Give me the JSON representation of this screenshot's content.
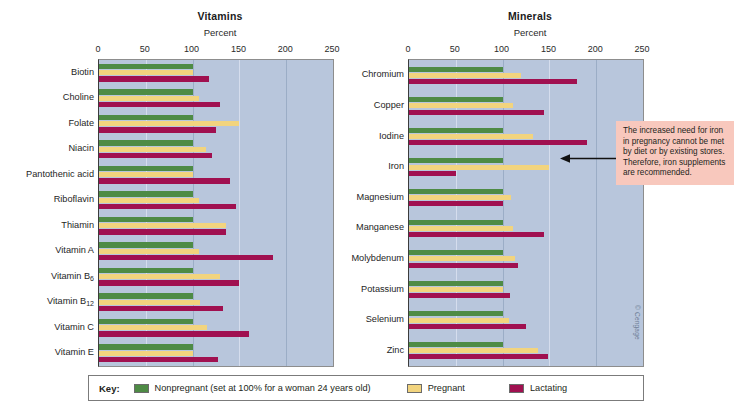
{
  "chart_data": [
    {
      "type": "bar",
      "orientation": "horizontal",
      "title": "Vitamins",
      "xlabel": "Percent",
      "ylabel": "",
      "xlim": [
        0,
        250
      ],
      "xticks": [
        0,
        50,
        100,
        150,
        200,
        250
      ],
      "grid": true,
      "legend_position": "bottom",
      "categories": [
        "Biotin",
        "Choline",
        "Folate",
        "Niacin",
        "Pantothenic acid",
        "Riboflavin",
        "Thiamin",
        "Vitamin A",
        "Vitamin B6",
        "Vitamin B12",
        "Vitamin C",
        "Vitamin E"
      ],
      "series": [
        {
          "name": "Nonpregnant (set at 100% for a woman 24 years old)",
          "color": "#4e8b45",
          "values": [
            100,
            100,
            100,
            100,
            100,
            100,
            100,
            100,
            100,
            100,
            100,
            100
          ]
        },
        {
          "name": "Pregnant",
          "color": "#f2d47e",
          "values": [
            100,
            107,
            150,
            114,
            100,
            107,
            136,
            107,
            129,
            108,
            115,
            100
          ]
        },
        {
          "name": "Lactating",
          "color": "#a01050",
          "values": [
            117,
            129,
            125,
            121,
            140,
            146,
            136,
            186,
            150,
            132,
            160,
            127
          ]
        }
      ]
    },
    {
      "type": "bar",
      "orientation": "horizontal",
      "title": "Minerals",
      "xlabel": "Percent",
      "ylabel": "",
      "xlim": [
        0,
        250
      ],
      "xticks": [
        0,
        50,
        100,
        150,
        200,
        250
      ],
      "grid": true,
      "legend_position": "bottom",
      "categories": [
        "Chromium",
        "Copper",
        "Iodine",
        "Iron",
        "Magnesium",
        "Manganese",
        "Molybdenum",
        "Potassium",
        "Selenium",
        "Zinc"
      ],
      "series": [
        {
          "name": "Nonpregnant (set at 100% for a woman 24 years old)",
          "color": "#4e8b45",
          "values": [
            100,
            100,
            100,
            100,
            100,
            100,
            100,
            100,
            100,
            100
          ]
        },
        {
          "name": "Pregnant",
          "color": "#f2d47e",
          "values": [
            120,
            111,
            132,
            150,
            109,
            111,
            113,
            100,
            107,
            138
          ]
        },
        {
          "name": "Lactating",
          "color": "#a01050",
          "values": [
            180,
            144,
            190,
            50,
            100,
            144,
            116,
            108,
            125,
            148
          ]
        }
      ]
    }
  ],
  "vitamins": {
    "title": "Vitamins",
    "axis_title": "Percent"
  },
  "minerals": {
    "title": "Minerals",
    "axis_title": "Percent"
  },
  "callout": {
    "text": "The increased need for iron in pregnancy cannot be met by diet or by existing stores. Therefore, iron supplements are recommended."
  },
  "legend": {
    "key_label": "Key:",
    "items": [
      {
        "label": "Nonpregnant (set at 100% for a woman 24 years old)",
        "color": "#4e8b45"
      },
      {
        "label": "Pregnant",
        "color": "#f2d47e"
      },
      {
        "label": "Lactating",
        "color": "#a01050"
      }
    ]
  },
  "copyright": "© Cengage"
}
